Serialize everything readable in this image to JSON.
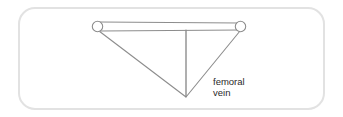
{
  "figure": {
    "frame": {
      "name": "rounded-border-frame",
      "stroke_color": "#e2e2e2",
      "fill_color": "#ffffff",
      "x": 18,
      "y": 7,
      "width": 307,
      "height": 103,
      "corner_radius": 16,
      "stroke_width": 2
    },
    "colors": {
      "line": "#8d8d8d",
      "line_dark": "#6f6f6f",
      "text": "#2a2a2a",
      "background": "#ffffff",
      "frame": "#e2e2e2"
    },
    "label": {
      "name": "femoral-vein-label",
      "line1": "femoral",
      "line2": "vein",
      "x": 213,
      "y1": 85,
      "y2": 96,
      "font_size": 9.5
    },
    "nodes": [
      {
        "name": "left-junction-circle",
        "cx": 97.5,
        "cy": 26.5,
        "r": 5.2
      },
      {
        "name": "right-junction-circle",
        "cx": 240.5,
        "cy": 26.5,
        "r": 5.2
      }
    ],
    "vessel": {
      "name": "horizontal-vessel-tube",
      "top_line": {
        "x1": 99,
        "y1": 22,
        "x2": 239,
        "y2": 23
      },
      "bottom_line": {
        "x1": 100,
        "y1": 31,
        "x2": 240,
        "y2": 30
      }
    },
    "limbs": [
      {
        "name": "left-diagonal-branch",
        "x1": 99,
        "y1": 31,
        "x2": 186,
        "y2": 97
      },
      {
        "name": "right-diagonal-branch",
        "x1": 240,
        "y1": 31,
        "x2": 186,
        "y2": 97
      },
      {
        "name": "central-vertical-branch",
        "x1": 186,
        "y1": 30,
        "x2": 186,
        "y2": 96
      }
    ],
    "apex": {
      "name": "vessel-apex-point",
      "x": 186,
      "y": 97
    }
  }
}
